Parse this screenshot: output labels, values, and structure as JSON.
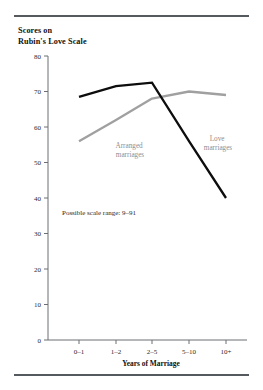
{
  "figure": {
    "title_line1": "Scores on",
    "title_line2": "Rubin's Love Scale",
    "annotation": "Possible scale range: 9–91",
    "xlabel": "Years of Marriage",
    "colors": {
      "love": "#0d0d0d",
      "arranged": "#a0a0a0",
      "rule": "#555a5e",
      "axis": "#6b6f73",
      "label_text": "#8e8e8e"
    },
    "series_labels": {
      "arranged_line1": "Arranged",
      "arranged_line2": "marriages",
      "love_line1": "Love",
      "love_line2": "marriages"
    }
  },
  "chart_data": {
    "type": "line",
    "title": "Scores on Rubin's Love Scale",
    "xlabel": "Years of Marriage",
    "ylabel": "Scores on Rubin's Love Scale",
    "categories": [
      "0–1",
      "1–2",
      "2–5",
      "5–10",
      "10+"
    ],
    "series": [
      {
        "name": "Love marriages",
        "color": "#0d0d0d",
        "values": [
          68.5,
          71.5,
          72.5,
          56,
          40
        ]
      },
      {
        "name": "Arranged marriages",
        "color": "#a0a0a0",
        "values": [
          56,
          62,
          68,
          70,
          69
        ]
      }
    ],
    "ylim": [
      0,
      80
    ],
    "yticks": [
      0,
      10,
      20,
      30,
      40,
      50,
      60,
      70,
      80
    ],
    "ytick_labels": [
      "0",
      "10",
      "20",
      "30",
      "40",
      "50",
      "60",
      "70",
      "80"
    ],
    "grid": false,
    "legend": "inline-annotations",
    "annotations": [
      "Possible scale range: 9–91"
    ]
  }
}
